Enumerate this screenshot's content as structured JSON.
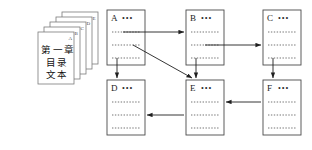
{
  "diagram": {
    "title_text_lines": [
      "第一章",
      "目录",
      "文本"
    ],
    "stack": {
      "name": "document-stack",
      "page_labels": [
        "A",
        "B",
        "C",
        "D",
        "E"
      ]
    },
    "nodes": [
      {
        "id": "A",
        "label": "A",
        "ellipsis": "•••",
        "row": "top",
        "col": 1
      },
      {
        "id": "B",
        "label": "B",
        "ellipsis": "•••",
        "row": "top",
        "col": 2
      },
      {
        "id": "C",
        "label": "C",
        "ellipsis": "•••",
        "row": "top",
        "col": 3
      },
      {
        "id": "D",
        "label": "D",
        "ellipsis": "•••",
        "row": "bottom",
        "col": 1
      },
      {
        "id": "E",
        "label": "E",
        "ellipsis": "•••",
        "row": "bottom",
        "col": 2
      },
      {
        "id": "F",
        "label": "F",
        "ellipsis": "•••",
        "row": "bottom",
        "col": 3
      }
    ],
    "edges": [
      {
        "from": "A",
        "to": "B",
        "kind": "horizontal"
      },
      {
        "from": "B",
        "to": "C",
        "kind": "horizontal"
      },
      {
        "from": "A",
        "to": "D",
        "kind": "vertical"
      },
      {
        "from": "A",
        "to": "E",
        "kind": "diagonal"
      },
      {
        "from": "B",
        "to": "E",
        "kind": "vertical"
      },
      {
        "from": "C",
        "to": "F",
        "kind": "vertical"
      },
      {
        "from": "F",
        "to": "E",
        "kind": "horizontal-left"
      },
      {
        "from": "E",
        "to": "D",
        "kind": "horizontal-left"
      }
    ],
    "colors": {
      "background": "#ffffff",
      "box_stroke": "#4a4a4a",
      "arrow": "#1f1f1f",
      "dotted_line": "#5a5a5a",
      "text": "#111111"
    }
  }
}
